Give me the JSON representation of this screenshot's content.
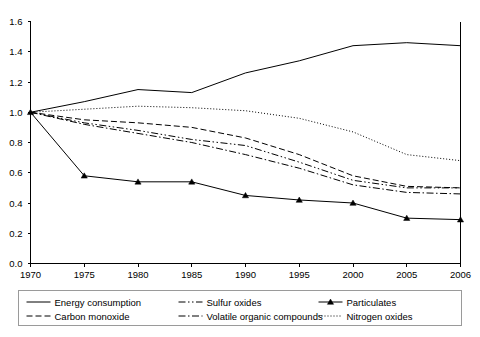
{
  "chart_data": {
    "type": "line",
    "title": "",
    "subtitle": "",
    "xlabel": "",
    "ylabel": "",
    "x": [
      1970,
      1975,
      1980,
      1985,
      1990,
      1995,
      2000,
      2005,
      2006
    ],
    "xtick_labels": [
      "1970",
      "1975",
      "1980",
      "1985",
      "1990",
      "1995",
      "2000",
      "2005",
      "2006"
    ],
    "ytick_labels": [
      "0.0",
      "0.2",
      "0.4",
      "0.6",
      "0.8",
      "1.0",
      "1.2",
      "1.4",
      "1.6"
    ],
    "ytick_values": [
      0.0,
      0.2,
      0.4,
      0.6,
      0.8,
      1.0,
      1.2,
      1.4,
      1.6
    ],
    "ylim": [
      0.0,
      1.6
    ],
    "grid": false,
    "legend_position": "bottom",
    "series": [
      {
        "name": "Energy consumption",
        "style": "solid",
        "marker": "none",
        "color": "#000000",
        "values": [
          1.0,
          1.07,
          1.15,
          1.13,
          1.26,
          1.34,
          1.44,
          1.46,
          1.44
        ]
      },
      {
        "name": "Carbon monoxide",
        "style": "dashed",
        "marker": "none",
        "color": "#000000",
        "values": [
          1.0,
          0.95,
          0.93,
          0.9,
          0.83,
          0.72,
          0.58,
          0.51,
          0.5
        ]
      },
      {
        "name": "Sulfur oxides",
        "style": "dash-dot-dot",
        "marker": "none",
        "color": "#000000",
        "values": [
          1.0,
          0.93,
          0.88,
          0.82,
          0.78,
          0.67,
          0.55,
          0.5,
          0.5
        ]
      },
      {
        "name": "Volatile organic compounds",
        "style": "dash-dot",
        "marker": "none",
        "color": "#000000",
        "values": [
          1.0,
          0.92,
          0.86,
          0.8,
          0.72,
          0.63,
          0.52,
          0.47,
          0.46
        ]
      },
      {
        "name": "Particulates",
        "style": "solid",
        "marker": "triangle",
        "color": "#000000",
        "values": [
          1.0,
          0.58,
          0.54,
          0.54,
          0.45,
          0.42,
          0.4,
          0.3,
          0.29
        ]
      },
      {
        "name": "Nitrogen oxides",
        "style": "dotted",
        "marker": "none",
        "color": "#000000",
        "values": [
          1.0,
          1.02,
          1.04,
          1.03,
          1.01,
          0.96,
          0.87,
          0.72,
          0.68
        ]
      }
    ]
  },
  "legend": {
    "entries": [
      {
        "label": "Energy consumption",
        "row": 0,
        "col": 0,
        "series_index": 0
      },
      {
        "label": "Sulfur oxides",
        "row": 0,
        "col": 1,
        "series_index": 2
      },
      {
        "label": "Particulates",
        "row": 0,
        "col": 2,
        "series_index": 4
      },
      {
        "label": "Carbon monoxide",
        "row": 1,
        "col": 0,
        "series_index": 1
      },
      {
        "label": "Volatile organic compounds",
        "row": 1,
        "col": 1,
        "series_index": 3
      },
      {
        "label": "Nitrogen oxides",
        "row": 1,
        "col": 2,
        "series_index": 5
      }
    ]
  },
  "colors": {
    "line": "#000000",
    "axis": "#000000",
    "legend_border": "#9a9a9a",
    "background": "#ffffff"
  }
}
